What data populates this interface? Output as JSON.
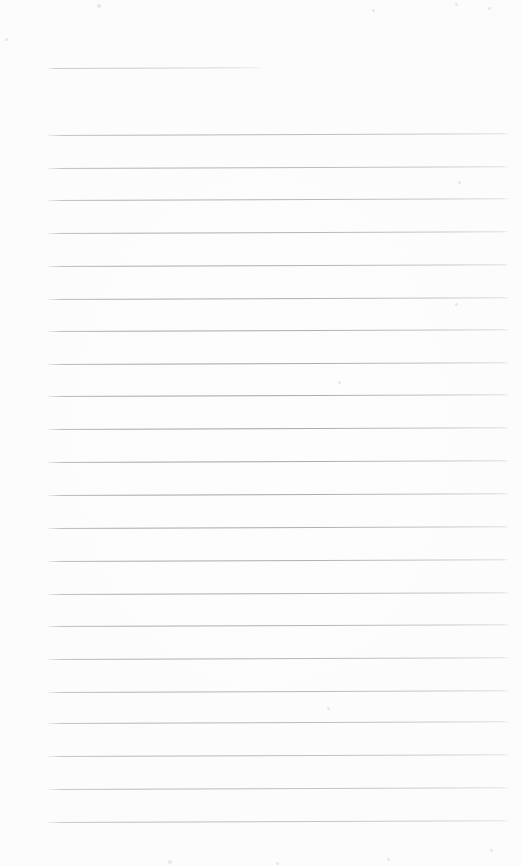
{
  "page": {
    "kind": "scanned-ruled-paper",
    "width": 522,
    "height": 866,
    "background_color": "#fdfdfd",
    "rule_color": "#969aa0",
    "text_content": "",
    "visible_text": []
  },
  "ruling": {
    "left_margin_x": 48,
    "right_edge_x": 508,
    "line_spacing": 32.7,
    "skew_degrees": -0.22,
    "header_line": {
      "label": "header-rule",
      "y": 68,
      "x_start": 48,
      "x_end": 262,
      "width": 214
    },
    "body_line_count": 22,
    "body_lines": [
      {
        "y": 135,
        "x_start": 48,
        "x_end": 508
      },
      {
        "y": 168,
        "x_start": 48,
        "x_end": 508
      },
      {
        "y": 200,
        "x_start": 48,
        "x_end": 508
      },
      {
        "y": 233,
        "x_start": 48,
        "x_end": 508
      },
      {
        "y": 266,
        "x_start": 48,
        "x_end": 508
      },
      {
        "y": 299,
        "x_start": 48,
        "x_end": 508
      },
      {
        "y": 331,
        "x_start": 48,
        "x_end": 508
      },
      {
        "y": 364,
        "x_start": 48,
        "x_end": 508
      },
      {
        "y": 396,
        "x_start": 48,
        "x_end": 508
      },
      {
        "y": 429,
        "x_start": 48,
        "x_end": 508
      },
      {
        "y": 462,
        "x_start": 48,
        "x_end": 508
      },
      {
        "y": 495,
        "x_start": 48,
        "x_end": 508
      },
      {
        "y": 528,
        "x_start": 48,
        "x_end": 508
      },
      {
        "y": 561,
        "x_start": 48,
        "x_end": 508
      },
      {
        "y": 594,
        "x_start": 48,
        "x_end": 508
      },
      {
        "y": 626,
        "x_start": 48,
        "x_end": 508
      },
      {
        "y": 659,
        "x_start": 48,
        "x_end": 508
      },
      {
        "y": 692,
        "x_start": 48,
        "x_end": 508
      },
      {
        "y": 723,
        "x_start": 48,
        "x_end": 508
      },
      {
        "y": 756,
        "x_start": 48,
        "x_end": 508
      },
      {
        "y": 789,
        "x_start": 48,
        "x_end": 508
      },
      {
        "y": 822,
        "x_start": 48,
        "x_end": 508
      }
    ]
  },
  "speckles": [
    {
      "x": 5,
      "y": 38,
      "size": 3
    },
    {
      "x": 97,
      "y": 4,
      "size": 4
    },
    {
      "x": 372,
      "y": 9,
      "size": 3
    },
    {
      "x": 455,
      "y": 3,
      "size": 3
    },
    {
      "x": 488,
      "y": 7,
      "size": 3
    },
    {
      "x": 458,
      "y": 181,
      "size": 3
    },
    {
      "x": 455,
      "y": 303,
      "size": 3
    },
    {
      "x": 338,
      "y": 381,
      "size": 3
    },
    {
      "x": 327,
      "y": 707,
      "size": 3
    },
    {
      "x": 490,
      "y": 849,
      "size": 3
    },
    {
      "x": 168,
      "y": 860,
      "size": 4
    },
    {
      "x": 276,
      "y": 862,
      "size": 3
    },
    {
      "x": 387,
      "y": 858,
      "size": 3
    }
  ]
}
